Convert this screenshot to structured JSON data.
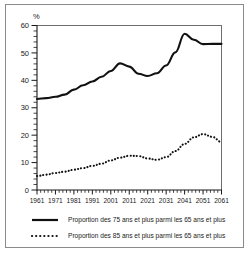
{
  "chart_data": {
    "type": "line",
    "title": "",
    "xlabel": "",
    "ylabel": "%",
    "ylim": [
      0,
      60
    ],
    "xlim": [
      1961,
      2061
    ],
    "grid": false,
    "legend_position": "bottom",
    "y_ticks": [
      0,
      10,
      20,
      30,
      40,
      50,
      60
    ],
    "y_minor_step": 2,
    "x_ticks": [
      1961,
      1971,
      1981,
      1991,
      2001,
      2011,
      2021,
      2031,
      2041,
      2051,
      2061
    ],
    "x_minor_step": 2,
    "x": [
      1961,
      1966,
      1971,
      1976,
      1981,
      1986,
      1991,
      1996,
      2001,
      2006,
      2011,
      2016,
      2021,
      2026,
      2031,
      2036,
      2041,
      2046,
      2051,
      2056,
      2061
    ],
    "series": [
      {
        "name": "Proportion des 75 ans et plus parmi les 65 ans et plus",
        "style": "solid",
        "values": [
          33.2,
          33.5,
          34.0,
          34.8,
          36.6,
          38.2,
          39.6,
          41.3,
          43.4,
          46.2,
          45.0,
          42.4,
          41.6,
          42.6,
          45.4,
          50.2,
          57.0,
          54.8,
          53.2,
          53.3,
          53.3
        ]
      },
      {
        "name": "Proportion des 85 ans et plus parmi les 65 ans et plus",
        "style": "dotted",
        "values": [
          5.1,
          5.6,
          6.2,
          6.7,
          7.4,
          8.0,
          8.8,
          9.6,
          10.8,
          11.8,
          12.5,
          12.4,
          11.5,
          11.0,
          12.0,
          14.2,
          16.8,
          19.2,
          20.4,
          19.4,
          17.5
        ]
      }
    ],
    "legend": [
      {
        "label": "Proportion des 75 ans et plus parmi les 65 ans et plus",
        "style": "solid"
      },
      {
        "label": "Proportion des 85 ans et plus parmi les 65 ans et plus",
        "style": "dotted"
      }
    ]
  },
  "axis": {
    "y_unit_label": "%",
    "y_tick_labels": [
      "60",
      "50",
      "40",
      "30",
      "20",
      "10",
      "0"
    ],
    "x_tick_labels": [
      "1961",
      "1971",
      "1981",
      "1991",
      "2001",
      "2011",
      "2021",
      "2031",
      "2041",
      "2051",
      "2061"
    ]
  },
  "colors": {
    "series": "#111111",
    "frame": "#6e6e6e",
    "border": "#8a8a8a",
    "text": "#1a1a1a",
    "background": "#ffffff"
  }
}
